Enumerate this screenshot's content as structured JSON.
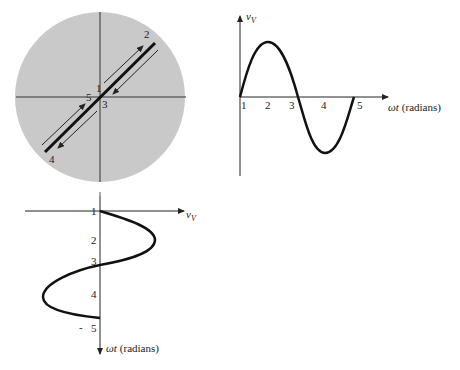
{
  "diagram": {
    "phasor_circle": {
      "fill_color": "#c9c9c9",
      "point_labels": [
        "1",
        "2",
        "3",
        "4",
        "5"
      ]
    },
    "waveform_plot": {
      "y_axis_label": "v",
      "y_axis_subscript": "V",
      "x_axis_label_symbol": "ωt",
      "x_axis_label_unit": "(radians)",
      "tick_labels": [
        "1",
        "2",
        "3",
        "4",
        "5"
      ]
    },
    "rotated_plot": {
      "h_axis_label": "v",
      "h_axis_subscript": "V",
      "v_axis_label_symbol": "ωt",
      "v_axis_label_unit": "(radians)",
      "tick_labels": [
        "1",
        "2",
        "3",
        "4",
        "5"
      ],
      "dash_mark": "-"
    }
  }
}
